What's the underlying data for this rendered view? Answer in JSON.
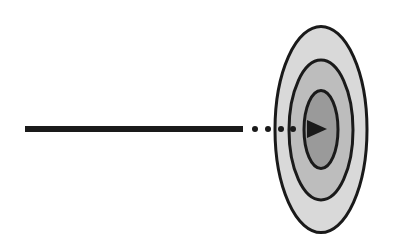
{
  "diagram": {
    "description": "Arrow hitting the center of a target",
    "colors": {
      "background": "#ffffff",
      "stroke": "#1a1a1a",
      "ring_outer": "#d9d9d9",
      "ring_middle": "#bdbdbd",
      "ring_inner": "#9a9a9a"
    },
    "arrow": {
      "shaft": {
        "x1": 25,
        "x2": 243,
        "y": 129,
        "width": 6
      },
      "dots_x": [
        255,
        268,
        281,
        293
      ],
      "dot_radius": 3,
      "head": {
        "tip_x": 327,
        "base_x": 307,
        "half_height": 9,
        "y": 129
      }
    },
    "target": {
      "cx": 321,
      "rings": [
        {
          "name": "outer",
          "cy": 129.5,
          "rx": 46,
          "ry": 103
        },
        {
          "name": "middle",
          "cy": 130,
          "rx": 32,
          "ry": 70
        },
        {
          "name": "inner",
          "cy": 129.5,
          "rx": 17,
          "ry": 39
        }
      ]
    }
  }
}
